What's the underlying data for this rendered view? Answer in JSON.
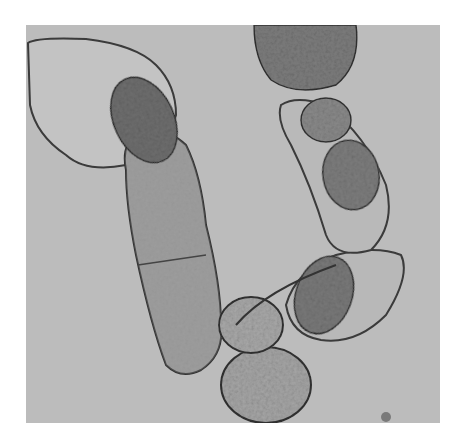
{
  "image": {
    "type": "grayscale light micrograph",
    "subject": "filamentous chain of plant/algal cells with granular cytoplasm",
    "background_color": "#ffffff",
    "field_color": "#bcbcbc",
    "cell_wall_color": "#3a3a3a",
    "cytoplasm_color": "#8a8a8a",
    "field_bounds": {
      "x": 26,
      "y": 25,
      "width": 414,
      "height": 398
    }
  }
}
